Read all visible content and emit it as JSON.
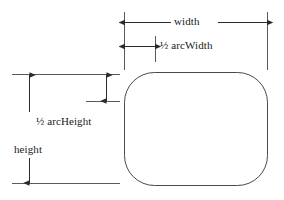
{
  "diagram": {
    "shape_name": "rounded-rectangle",
    "stroke_color": "#3c3c3c",
    "line_color": "#2b2b2b",
    "background_color": "#ffffff",
    "labels": {
      "width": "width",
      "half_arc_width": "½ arcWidth",
      "half_arc_height": "½ arcHeight",
      "height": "height"
    },
    "geometry": {
      "rect_left": 124,
      "rect_top": 72,
      "rect_right": 268,
      "rect_bottom": 186,
      "corner_radius": 30,
      "width_px": 144,
      "height_px": 114
    }
  }
}
